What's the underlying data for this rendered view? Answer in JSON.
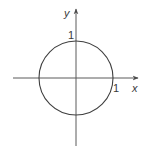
{
  "diagram": {
    "type": "unit-circle-on-axes",
    "axes": {
      "x_label": "x",
      "y_label": "y"
    },
    "circle": {
      "center": [
        0,
        0
      ],
      "radius": 1
    },
    "annotations": {
      "y_intercept_label": "1",
      "x_intercept_label": "1"
    },
    "colors": {
      "line": "#4a4a4a",
      "background": "#ffffff"
    }
  }
}
